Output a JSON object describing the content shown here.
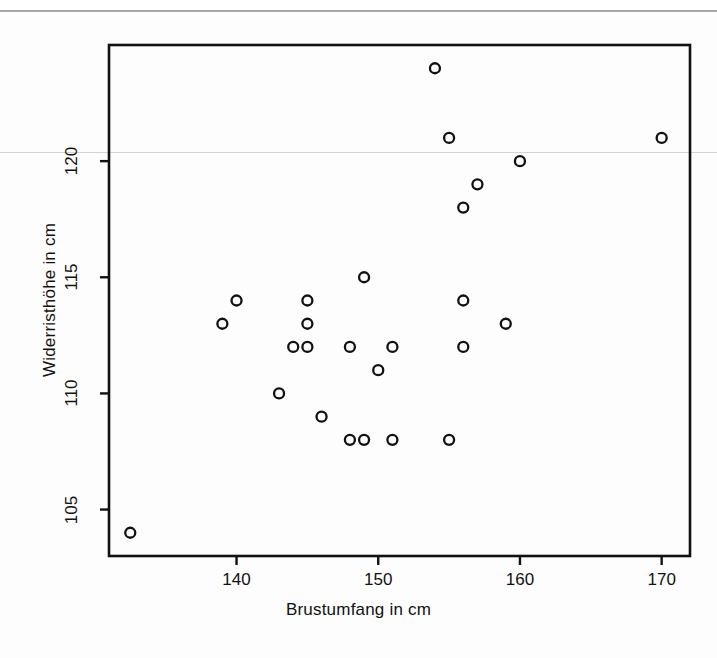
{
  "figure": {
    "background": "#fdfdfd",
    "ink_color": "#111111",
    "marker": "open-circle"
  },
  "chart_data": {
    "type": "scatter",
    "title": "",
    "xlabel": "Brustumfang in cm",
    "ylabel": "Widerristhöhe in cm",
    "xlim": [
      131,
      172
    ],
    "ylim": [
      103,
      125
    ],
    "xticks": [
      140,
      150,
      160,
      170
    ],
    "yticks": [
      105,
      110,
      115,
      120
    ],
    "grid": false,
    "legend": null,
    "series": [
      {
        "name": "Pferde",
        "marker": "o",
        "points": [
          {
            "x": 132.5,
            "y": 104
          },
          {
            "x": 139,
            "y": 113
          },
          {
            "x": 140,
            "y": 114
          },
          {
            "x": 143,
            "y": 110
          },
          {
            "x": 144,
            "y": 112
          },
          {
            "x": 145,
            "y": 112
          },
          {
            "x": 145,
            "y": 113
          },
          {
            "x": 145,
            "y": 114
          },
          {
            "x": 146,
            "y": 109
          },
          {
            "x": 148,
            "y": 108
          },
          {
            "x": 148,
            "y": 112
          },
          {
            "x": 149,
            "y": 108
          },
          {
            "x": 149,
            "y": 115
          },
          {
            "x": 150,
            "y": 111
          },
          {
            "x": 151,
            "y": 108
          },
          {
            "x": 151,
            "y": 112
          },
          {
            "x": 154,
            "y": 124
          },
          {
            "x": 155,
            "y": 108
          },
          {
            "x": 155,
            "y": 121
          },
          {
            "x": 156,
            "y": 112
          },
          {
            "x": 156,
            "y": 114
          },
          {
            "x": 156,
            "y": 118
          },
          {
            "x": 157,
            "y": 119
          },
          {
            "x": 159,
            "y": 113
          },
          {
            "x": 160,
            "y": 120
          },
          {
            "x": 170,
            "y": 121
          }
        ]
      }
    ]
  }
}
